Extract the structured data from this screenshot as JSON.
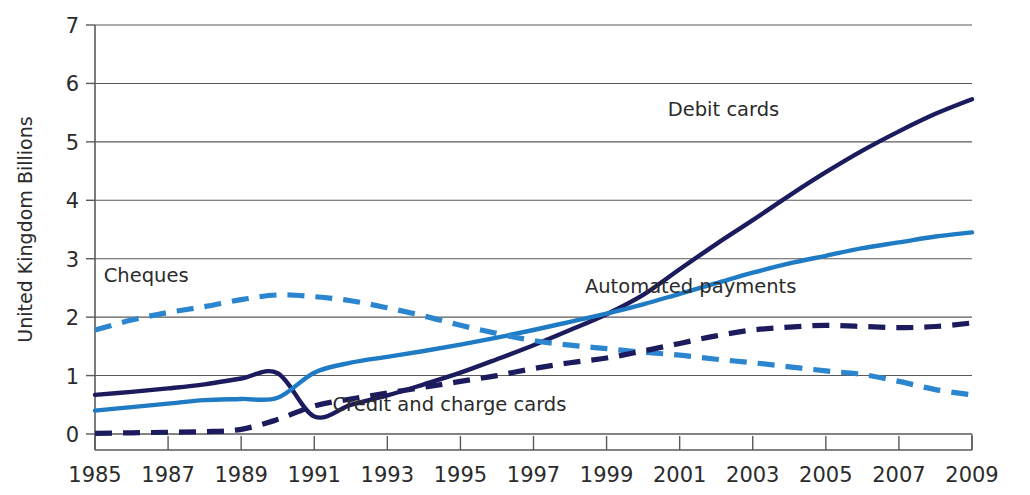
{
  "chart_data": {
    "type": "line",
    "title": "",
    "subtitle": "",
    "xlabel": "",
    "ylabel": "United Kingdom Billions",
    "xlim": [
      1985,
      2009
    ],
    "ylim": [
      0,
      7
    ],
    "ytick_labels": [
      "0",
      "1",
      "2",
      "3",
      "4",
      "5",
      "6",
      "7"
    ],
    "ytick_values": [
      0,
      1,
      2,
      3,
      4,
      5,
      6,
      7
    ],
    "xtick_labels": [
      "1985",
      "1987",
      "1989",
      "1991",
      "1993",
      "1995",
      "1997",
      "1999",
      "2001",
      "2003",
      "2005",
      "2007",
      "2009"
    ],
    "xtick_values": [
      1985,
      1987,
      1989,
      1991,
      1993,
      1995,
      1997,
      1999,
      2001,
      2003,
      2005,
      2007,
      2009
    ],
    "grid": "horizontal",
    "legend_position": "inline-annotations",
    "x": [
      1985,
      1986,
      1987,
      1988,
      1989,
      1990,
      1991,
      1992,
      1993,
      1994,
      1995,
      1996,
      1997,
      1998,
      1999,
      2000,
      2001,
      2002,
      2003,
      2004,
      2005,
      2006,
      2007,
      2008,
      2009
    ],
    "series": [
      {
        "name": "Debit cards",
        "color": "#1b1b5e",
        "style": "solid",
        "label_x": 2002.2,
        "label_y": 5.45,
        "values": [
          0.67,
          0.72,
          0.78,
          0.85,
          0.95,
          1.04,
          0.3,
          0.5,
          0.66,
          0.85,
          1.05,
          1.28,
          1.52,
          1.78,
          2.05,
          2.38,
          2.82,
          3.25,
          3.66,
          4.08,
          4.48,
          4.85,
          5.18,
          5.48,
          5.73
        ]
      },
      {
        "name": "Automated payments",
        "color": "#1f7bc4",
        "style": "solid",
        "label_x": 2001.3,
        "label_y": 2.42,
        "values": [
          0.4,
          0.46,
          0.52,
          0.58,
          0.6,
          0.62,
          1.05,
          1.22,
          1.32,
          1.42,
          1.53,
          1.65,
          1.78,
          1.92,
          2.06,
          2.22,
          2.4,
          2.58,
          2.76,
          2.92,
          3.05,
          3.18,
          3.28,
          3.38,
          3.45
        ]
      },
      {
        "name": "Cheques",
        "color": "#2b86cf",
        "style": "dashed",
        "label_x": 1986.4,
        "label_y": 2.6,
        "values": [
          1.78,
          1.95,
          2.08,
          2.18,
          2.3,
          2.38,
          2.35,
          2.28,
          2.16,
          2.02,
          1.86,
          1.72,
          1.6,
          1.52,
          1.46,
          1.4,
          1.35,
          1.28,
          1.22,
          1.15,
          1.08,
          1.02,
          0.9,
          0.76,
          0.67
        ]
      },
      {
        "name": "Credit and charge cards",
        "color": "#1b1b5e",
        "style": "dashed",
        "label_x": 1994.7,
        "label_y": 0.4,
        "values": [
          0.01,
          0.02,
          0.03,
          0.04,
          0.08,
          0.25,
          0.48,
          0.6,
          0.7,
          0.8,
          0.9,
          1.0,
          1.12,
          1.22,
          1.3,
          1.42,
          1.55,
          1.68,
          1.78,
          1.83,
          1.86,
          1.84,
          1.82,
          1.84,
          1.9
        ]
      }
    ]
  }
}
